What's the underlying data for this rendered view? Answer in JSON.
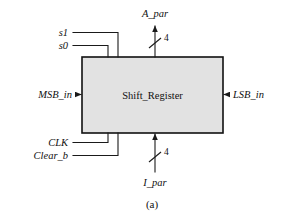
{
  "figure": {
    "caption": "(a)",
    "background_color": "#ffffff",
    "line_color": "#1a1a1a"
  },
  "block": {
    "label": "Shift_Register",
    "fill_color": "#e2e2e2",
    "border_color": "#111111",
    "x": 82,
    "y": 57,
    "width": 141,
    "height": 76
  },
  "signals": {
    "select_inputs": [
      {
        "label": "s1",
        "label_x": 68,
        "label_y": 36,
        "wire_x": 118
      },
      {
        "label": "s0",
        "label_x": 68,
        "label_y": 49,
        "wire_x": 108
      }
    ],
    "control_inputs": [
      {
        "label": "CLK",
        "label_x": 68,
        "label_y": 146,
        "wire_x": 108
      },
      {
        "label": "Clear_b",
        "label_x": 68,
        "label_y": 159,
        "wire_x": 118
      }
    ],
    "serial_in_left": {
      "label": "MSB_in",
      "label_x": 72,
      "label_y": 98
    },
    "serial_in_right": {
      "label": "LSB_in",
      "label_x": 233,
      "label_y": 98
    },
    "parallel_out_top": {
      "label": "A_par",
      "label_x": 155,
      "label_y": 17,
      "bus_width": "4",
      "bus_width_x": 165,
      "bus_width_y": 41
    },
    "parallel_in_bottom": {
      "label": "I_par",
      "label_x": 155,
      "label_y": 186,
      "bus_width": "4",
      "bus_width_x": 165,
      "bus_width_y": 155
    }
  }
}
